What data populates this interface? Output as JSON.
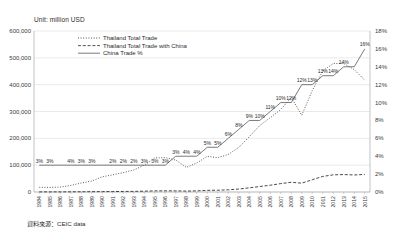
{
  "figure": {
    "unit_label": "Unit: million USD",
    "source_label": "資料來源：CEIC data"
  },
  "legend": {
    "position": "top-left-inside",
    "entries": [
      {
        "label": "Thailand Total Trade",
        "style": "dotted"
      },
      {
        "label": "Thailand Total Trade with China",
        "style": "dashed"
      },
      {
        "label": "China Trade %",
        "style": "solid"
      }
    ]
  },
  "chart_data": {
    "type": "line",
    "title": "",
    "subtitle": "",
    "xlabel": "",
    "ylabel": "Unit: million USD",
    "y2label": "",
    "grid": true,
    "legend_position": "top-left-inside",
    "ylim": [
      0,
      600000
    ],
    "y2lim": [
      0,
      0.18
    ],
    "yticks": [
      "0",
      "100,000",
      "200,000",
      "300,000",
      "400,000",
      "500,000",
      "600,000"
    ],
    "y2ticks": [
      "0%",
      "2%",
      "4%",
      "6%",
      "8%",
      "10%",
      "12%",
      "14%",
      "16%",
      "18%"
    ],
    "categories": [
      "1984",
      "1985",
      "1986",
      "1987",
      "1988",
      "1989",
      "1990",
      "1991",
      "1992",
      "1993",
      "1994",
      "1995",
      "1996",
      "1997",
      "1998",
      "1999",
      "2000",
      "2001",
      "2002",
      "2003",
      "2004",
      "2005",
      "2006",
      "2007",
      "2008",
      "2009",
      "2010",
      "2011",
      "2012",
      "2013",
      "2014",
      "2015"
    ],
    "series": [
      {
        "name": "Thailand Total Trade",
        "axis": "left",
        "style": "dotted",
        "values": [
          17500,
          17000,
          18500,
          24500,
          33500,
          41000,
          56500,
          64000,
          72000,
          82000,
          100000,
          127000,
          128000,
          119000,
          92000,
          108000,
          133000,
          128000,
          140000,
          166000,
          206000,
          248000,
          277000,
          307000,
          353000,
          286000,
          378000,
          451000,
          479000,
          479000,
          456000,
          417000
        ]
      },
      {
        "name": "Thailand Total Trade with China",
        "axis": "left",
        "style": "dashed",
        "values": [
          480,
          500,
          520,
          700,
          950,
          1150,
          1500,
          1750,
          2000,
          2400,
          3000,
          4200,
          4400,
          4300,
          3400,
          4200,
          6200,
          6500,
          8200,
          11000,
          15500,
          20400,
          25200,
          31300,
          36200,
          33000,
          45700,
          58000,
          64000,
          65000,
          63500,
          65500
        ]
      },
      {
        "name": "China Trade %",
        "axis": "right",
        "style": "solid",
        "values": [
          0.03,
          0.03,
          0.03,
          0.03,
          0.03,
          0.03,
          0.03,
          0.03,
          0.03,
          0.03,
          0.03,
          0.03,
          0.03,
          0.04,
          0.04,
          0.04,
          0.05,
          0.05,
          0.06,
          0.07,
          0.08,
          0.08,
          0.09,
          0.1,
          0.1,
          0.12,
          0.12,
          0.13,
          0.13,
          0.14,
          0.14,
          0.16
        ],
        "data_labels": [
          "3%",
          "3%",
          "",
          "4%",
          "3%",
          "3%",
          "",
          "2%",
          "2%",
          "2%",
          "3%",
          "3%",
          "3%",
          "3%",
          "4%",
          "4%",
          "5%",
          "5%",
          "6%",
          "8%",
          "9%",
          "10%",
          "11%",
          "10%",
          "12%",
          "12%",
          "13%",
          "13%",
          "14%",
          "14%",
          "",
          "16%"
        ]
      }
    ]
  }
}
